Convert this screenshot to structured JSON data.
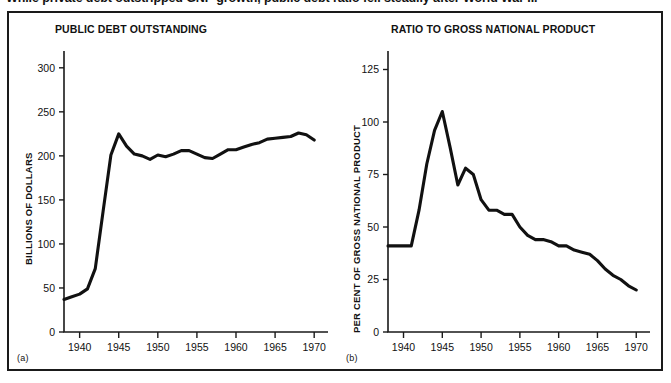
{
  "caption": {
    "text": "While private debt outstripped GNP growth, public debt ratio fell steadily after World War II."
  },
  "figure": {
    "panel_a": {
      "letter": "(a)",
      "title": "PUBLIC DEBT OUTSTANDING",
      "ylabel": "BILLIONS OF DOLLARS"
    },
    "panel_b": {
      "letter": "(b)",
      "title": "RATIO TO GROSS NATIONAL PRODUCT",
      "ylabel": "PER CENT OF GROSS NATIONAL PRODUCT"
    }
  },
  "colors": {
    "curve": "#111111",
    "axis": "#1a1a1a",
    "frame": "#1a1a1a",
    "background": "#ffffff"
  },
  "chart_data": [
    {
      "type": "line",
      "id": "public-debt-outstanding",
      "title": "PUBLIC DEBT OUTSTANDING",
      "xlabel": "",
      "ylabel": "BILLIONS OF DOLLARS",
      "xlim": [
        1938,
        1971
      ],
      "ylim": [
        0,
        310
      ],
      "yticks": [
        0,
        50,
        100,
        150,
        200,
        250,
        300
      ],
      "xticks": [
        1940,
        1945,
        1950,
        1955,
        1960,
        1965,
        1970
      ],
      "grid": false,
      "legend": "none",
      "x": [
        1938,
        1939,
        1940,
        1941,
        1942,
        1943,
        1944,
        1945,
        1946,
        1947,
        1948,
        1949,
        1950,
        1951,
        1952,
        1953,
        1954,
        1955,
        1956,
        1957,
        1958,
        1959,
        1960,
        1961,
        1962,
        1963,
        1964,
        1965,
        1966,
        1967,
        1968,
        1969,
        1970
      ],
      "values": [
        37,
        40,
        43,
        49,
        72,
        137,
        201,
        225,
        211,
        202,
        200,
        196,
        201,
        199,
        202,
        206,
        206,
        202,
        198,
        197,
        202,
        207,
        207,
        210,
        213,
        215,
        219,
        220,
        221,
        222,
        226,
        224,
        218
      ]
    },
    {
      "type": "line",
      "id": "ratio-to-gross-national-product",
      "title": "RATIO TO GROSS NATIONAL PRODUCT",
      "xlabel": "",
      "ylabel": "PER CENT OF GROSS NATIONAL PRODUCT",
      "xlim": [
        1938,
        1971
      ],
      "ylim": [
        0,
        130
      ],
      "yticks": [
        0,
        25,
        50,
        75,
        100,
        125
      ],
      "xticks": [
        1940,
        1945,
        1950,
        1955,
        1960,
        1965,
        1970
      ],
      "grid": false,
      "legend": "none",
      "x": [
        1938,
        1939,
        1940,
        1941,
        1942,
        1943,
        1944,
        1945,
        1946,
        1947,
        1948,
        1949,
        1950,
        1951,
        1952,
        1953,
        1954,
        1955,
        1956,
        1957,
        1958,
        1959,
        1960,
        1961,
        1962,
        1963,
        1964,
        1965,
        1966,
        1967,
        1968,
        1969,
        1970
      ],
      "values": [
        41,
        41,
        41,
        41,
        58,
        80,
        96,
        105,
        88,
        70,
        78,
        75,
        63,
        58,
        58,
        56,
        56,
        50,
        46,
        44,
        44,
        43,
        41,
        41,
        39,
        38,
        37,
        34,
        30,
        27,
        25,
        22,
        20
      ]
    }
  ]
}
